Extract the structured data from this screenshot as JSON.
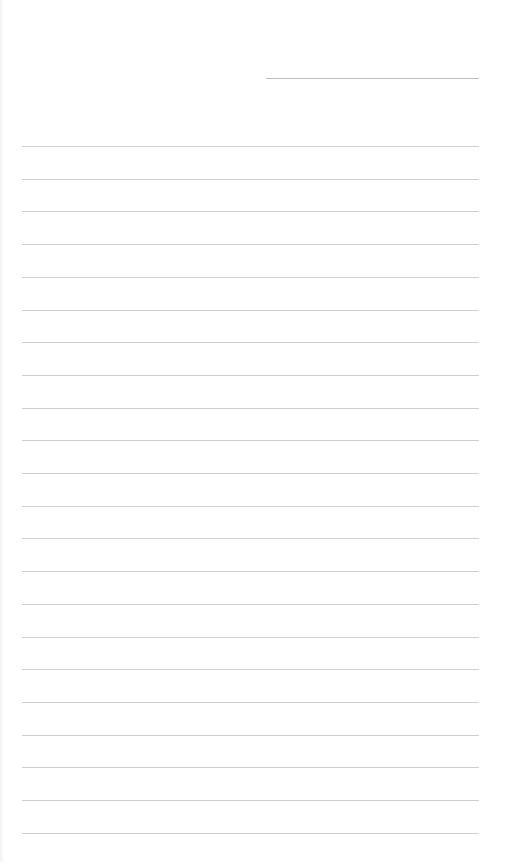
{
  "page": {
    "type": "lined-notepaper",
    "background_color": "#ffffff",
    "line_color": "#cfcfcf"
  },
  "header": {
    "date_field_line": {
      "x": 266,
      "y": 78,
      "width": 213,
      "value": ""
    }
  },
  "ruled_lines": {
    "count": 22,
    "start_y": 146,
    "spacing": 32.7,
    "x": 22,
    "width": 457,
    "rows": [
      "",
      "",
      "",
      "",
      "",
      "",
      "",
      "",
      "",
      "",
      "",
      "",
      "",
      "",
      "",
      "",
      "",
      "",
      "",
      "",
      "",
      ""
    ]
  }
}
